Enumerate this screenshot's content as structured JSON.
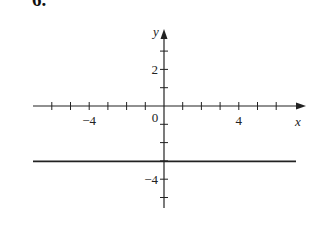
{
  "problem_number": "6.",
  "chart_data": {
    "type": "line",
    "title": "",
    "xlabel": "x",
    "ylabel": "y",
    "xlim": [
      -7,
      7
    ],
    "ylim": [
      -5,
      4
    ],
    "x_ticks": [
      -6,
      -5,
      -4,
      -3,
      -2,
      -1,
      1,
      2,
      3,
      4,
      5,
      6
    ],
    "y_ticks": [
      -5,
      -4,
      -3,
      -2,
      -1,
      1,
      2,
      3
    ],
    "x_tick_labels": [
      {
        "value": -4,
        "label": "−4"
      },
      {
        "value": 4,
        "label": "4"
      }
    ],
    "y_tick_labels": [
      {
        "value": 2,
        "label": "2"
      },
      {
        "value": -4,
        "label": "−4"
      }
    ],
    "origin_label": "0",
    "grid": false,
    "series": [
      {
        "name": "y = -3",
        "x": [
          -7,
          7
        ],
        "values": [
          -3,
          -3
        ],
        "color": "#222222"
      }
    ]
  },
  "style": {
    "axis_color": "#222222",
    "line_color": "#222222"
  }
}
